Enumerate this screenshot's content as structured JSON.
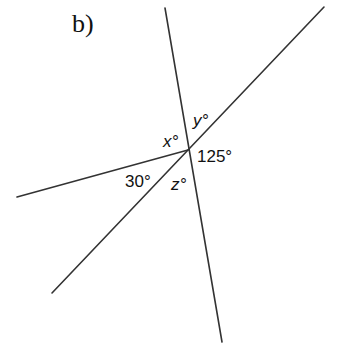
{
  "part_label": "b)",
  "labels": {
    "x": "x°",
    "y": "y°",
    "z": "z°",
    "angle_125": "125°",
    "angle_30": "30°"
  },
  "diagram": {
    "intersection": {
      "x": 188,
      "y": 150
    },
    "lines": [
      {
        "name": "near-vertical-line",
        "from": {
          "x": 165,
          "y": 8
        },
        "to": {
          "x": 222,
          "y": 342
        }
      },
      {
        "name": "diagonal-line",
        "from": {
          "x": 52,
          "y": 293
        },
        "to": {
          "x": 324,
          "y": 7
        }
      },
      {
        "name": "left-ray",
        "from": {
          "x": 17,
          "y": 197
        },
        "to": {
          "x": 188,
          "y": 150
        }
      }
    ],
    "angles": [
      {
        "label": "x°",
        "region": "left of vertical, above left ray"
      },
      {
        "label": "y°",
        "region": "between vertical (up) and diagonal (up-right)"
      },
      {
        "label": "125°",
        "region": "between diagonal (up-right) and vertical (down)"
      },
      {
        "label": "z°",
        "region": "between diagonal (down-left) and vertical (down)"
      },
      {
        "label": "30°",
        "region": "between left ray and diagonal (down-left)"
      }
    ]
  }
}
